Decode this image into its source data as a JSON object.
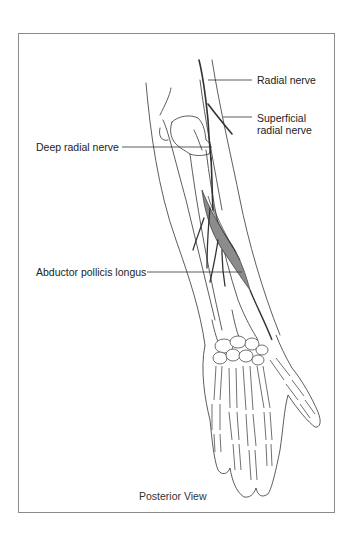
{
  "figure": {
    "view_caption": "Posterior View",
    "labels": [
      {
        "id": "radial-nerve",
        "text": "Radial nerve"
      },
      {
        "id": "superficial-radial-nerve",
        "line1": "Superficial",
        "line2": "radial nerve"
      },
      {
        "id": "deep-radial-nerve",
        "text": "Deep radial nerve"
      },
      {
        "id": "abductor-pollicis-longus",
        "text": "Abductor pollicis longus"
      }
    ],
    "colors": {
      "line": "#333333",
      "muscle_fill": "#8c8c8c",
      "frame": "#8a8a8a"
    }
  }
}
